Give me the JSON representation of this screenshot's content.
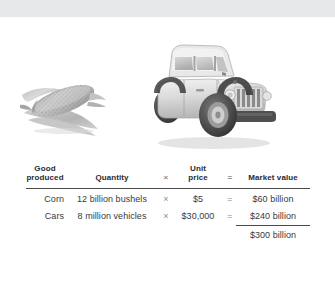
{
  "figure": {
    "band_color": "#e7e8e9",
    "background_color": "#ffffff"
  },
  "illustrations": [
    {
      "name": "corn-photo",
      "caption": "Ear of corn",
      "alt": "Grayscale photograph of an ear of corn with husk"
    },
    {
      "name": "jeep-photo",
      "caption": "Jeep vehicle",
      "alt": "Grayscale photograph of a white Jeep Wrangler SUV"
    }
  ],
  "table": {
    "headers": {
      "good_produced_line1": "Good",
      "good_produced_line2": "produced",
      "quantity": "Quantity",
      "times_symbol": "×",
      "unit_price_line1": "Unit",
      "unit_price_line2": "price",
      "equals_symbol": "=",
      "market_value": "Market value"
    },
    "rows": [
      {
        "good": "Corn",
        "quantity": "12 billion bushels",
        "times": "×",
        "unit_price": "$5",
        "equals": "=",
        "market_value": "$60 billion"
      },
      {
        "good": "Cars",
        "quantity": "8 million vehicles",
        "times": "×",
        "unit_price": "$30,000",
        "equals": "=",
        "market_value": "$240 billion"
      }
    ],
    "total": {
      "label": "",
      "market_value": "$300 billion"
    }
  }
}
